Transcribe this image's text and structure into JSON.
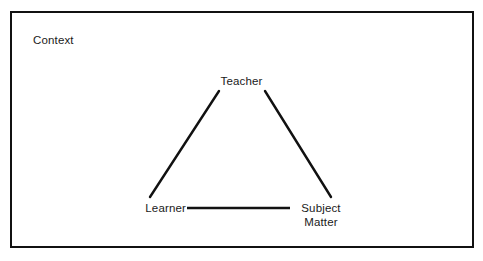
{
  "figure": {
    "name": "didactic-triangle",
    "frame_label": "Context",
    "colors": {
      "stroke": "#111111",
      "text": "#1a1a1a",
      "background": "#ffffff"
    },
    "vertices": {
      "top": "Teacher",
      "bottom_left": "Learner",
      "bottom_right_line1": "Subject",
      "bottom_right_line2": "Matter"
    },
    "edges": [
      {
        "name": "teacher-learner",
        "from": "Teacher",
        "to": "Learner"
      },
      {
        "name": "teacher-subject-matter",
        "from": "Teacher",
        "to": "Subject Matter"
      },
      {
        "name": "learner-subject-matter",
        "from": "Learner",
        "to": "Subject Matter"
      }
    ]
  }
}
